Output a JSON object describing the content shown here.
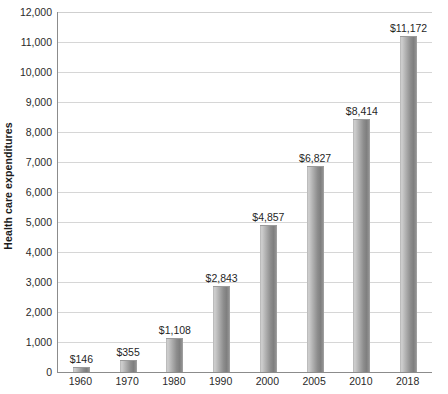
{
  "chart_data": {
    "type": "bar",
    "title": "",
    "xlabel": "",
    "ylabel": "Health care expenditures",
    "ylim": [
      0,
      12000
    ],
    "ytick_step": 1000,
    "grid": true,
    "legend": "none",
    "categories": [
      "1960",
      "1970",
      "1980",
      "1990",
      "2000",
      "2005",
      "2010",
      "2018"
    ],
    "values": [
      146,
      355,
      1108,
      2843,
      4857,
      6827,
      8414,
      11172
    ],
    "value_labels": [
      "$146",
      "$355",
      "$1,108",
      "$2,843",
      "$4,857",
      "$6,827",
      "$8,414",
      "$11,172"
    ],
    "ytick_labels": [
      "0",
      "1,000",
      "2,000",
      "3,000",
      "4,000",
      "5,000",
      "6,000",
      "7,000",
      "8,000",
      "9,000",
      "10,000",
      "11,000",
      "12,000"
    ],
    "series": [
      {
        "name": "Health care expenditures",
        "values": [
          146,
          355,
          1108,
          2843,
          4857,
          6827,
          8414,
          11172
        ]
      }
    ]
  },
  "colors": {
    "background": "#ffffff",
    "bar_light": "#cfcfcf",
    "bar_mid": "#a6a6a6",
    "bar_dark": "#7f7f7f",
    "gridline": "#d6d6d6",
    "axis": "#8c8c8c",
    "text": "#1f1f1f"
  }
}
